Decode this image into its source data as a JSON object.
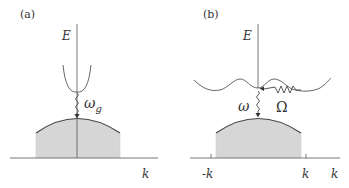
{
  "panels": [
    {
      "id": "a",
      "label": "(a)",
      "y_axis_label": "E",
      "x_axis_label": "k",
      "transition_label_main": "ω",
      "transition_label_sub": "g",
      "description": "Direct gap: parabolic conduction band minimum above valence band maximum at k=0"
    },
    {
      "id": "b",
      "label": "(b)",
      "y_axis_label": "E",
      "x_axis_label": "k",
      "transition_label": "ω",
      "phonon_label": "Ω",
      "tick_labels": [
        "-k",
        "k"
      ],
      "description": "Indirect gap: multi-valley conduction band, photon ω plus phonon Ω transition"
    }
  ],
  "colors": {
    "line": "#555555",
    "fill": "#d6d6d6",
    "dome_edge": "#444444"
  }
}
